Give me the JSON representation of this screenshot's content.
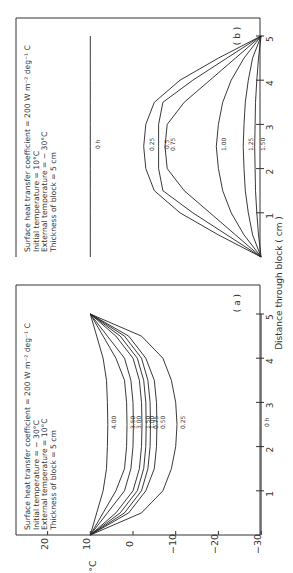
{
  "chart_data": [
    {
      "panel": "(a)",
      "type": "line",
      "title": "",
      "annotation": [
        "Surface heat transfer coefficient = 200 W m⁻² deg⁻¹ C",
        "Initial temperature = − 30°C",
        "External temperature = 10°C",
        "Thickness of block = 5 cm"
      ],
      "xlabel": "Distance through block ( cm )",
      "ylabel": "°C",
      "xticks": [
        "1",
        "2",
        "3",
        "4",
        "5"
      ],
      "yticks": [
        "20",
        "10",
        "0",
        "−10",
        "−20",
        "−30"
      ],
      "xlim": [
        0,
        5
      ],
      "ylim": [
        -30,
        20
      ],
      "x": [
        0,
        0.5,
        1,
        1.5,
        2,
        2.5,
        3,
        3.5,
        4,
        4.5,
        5
      ],
      "series": [
        {
          "name": "0 h",
          "values": [
            -30,
            -30,
            -30,
            -30,
            -30,
            -30,
            -30,
            -30,
            -30,
            -30,
            -30
          ]
        },
        {
          "name": "0.25",
          "values": [
            10,
            -2,
            -7,
            -9,
            -10,
            -10.3,
            -10,
            -9,
            -7,
            -2,
            10
          ]
        },
        {
          "name": "0.50",
          "values": [
            10,
            1,
            -3,
            -5,
            -5.5,
            -5.6,
            -5.5,
            -5,
            -3,
            1,
            10
          ]
        },
        {
          "name": "0.75",
          "values": [
            10,
            2,
            -2,
            -3.5,
            -4,
            -4.1,
            -4,
            -3.5,
            -2,
            2,
            10
          ]
        },
        {
          "name": "1.00",
          "values": [
            10,
            3,
            -1,
            -2.5,
            -3,
            -3.1,
            -3,
            -2.5,
            -1,
            3,
            10
          ]
        },
        {
          "name": "1.50",
          "values": [
            10,
            4,
            0,
            -1.5,
            -2,
            -2.1,
            -2,
            -1.5,
            0,
            4,
            10
          ]
        },
        {
          "name": "3.00",
          "values": [
            10,
            6,
            2,
            0.5,
            0,
            -0.1,
            0,
            0.5,
            2,
            6,
            10
          ]
        },
        {
          "name": "3.50",
          "values": [
            10,
            7,
            4,
            2,
            1.5,
            1.4,
            1.5,
            2,
            4,
            7,
            10
          ]
        },
        {
          "name": "4.00",
          "values": [
            10,
            8.5,
            7,
            6.2,
            6,
            5.9,
            6,
            6.2,
            7,
            8.5,
            10
          ]
        }
      ],
      "labels": [
        "0 h",
        "0.25",
        "0.50",
        "0.75",
        "1.00",
        "1.50",
        "3.00",
        "3.50",
        "4.00"
      ]
    },
    {
      "panel": "(b)",
      "type": "line",
      "title": "",
      "annotation": [
        "Surface heat transfer coefficient = 200 W m⁻² deg⁻¹ C",
        "Initial temperature = 10°C",
        "External temperature = − 30°C",
        "Thickness of block = 5 cm"
      ],
      "xlabel": "Distance through block ( cm )",
      "ylabel": "°C",
      "xticks": [
        "1",
        "2",
        "3",
        "4",
        "5"
      ],
      "xlim": [
        0,
        5
      ],
      "ylim": [
        -30,
        20
      ],
      "x": [
        0,
        0.5,
        1,
        1.5,
        2,
        2.5,
        3,
        3.5,
        4,
        4.5,
        5
      ],
      "series": [
        {
          "name": "0 h",
          "values": [
            10,
            10,
            10,
            10,
            10,
            10,
            10,
            10,
            10,
            10,
            10
          ]
        },
        {
          "name": "0.25",
          "values": [
            -30,
            -20,
            -11,
            -5,
            -3,
            -2.5,
            -3,
            -5,
            -11,
            -20,
            -30
          ]
        },
        {
          "name": "0.5",
          "values": [
            -30,
            -22,
            -14,
            -7,
            -6,
            -6,
            -6,
            -7,
            -14,
            -22,
            -30
          ]
        },
        {
          "name": "0.75",
          "values": [
            -30,
            -24,
            -18,
            -12,
            -8,
            -7.5,
            -8,
            -12,
            -18,
            -24,
            -30
          ]
        },
        {
          "name": "1.00",
          "values": [
            -30,
            -26,
            -23,
            -21,
            -20,
            -19.5,
            -20,
            -21,
            -23,
            -26,
            -30
          ]
        },
        {
          "name": "1.25",
          "values": [
            -30,
            -28,
            -27,
            -26.3,
            -26,
            -25.8,
            -26,
            -26.3,
            -27,
            -28,
            -30
          ]
        },
        {
          "name": "1.50",
          "values": [
            -30,
            -29.4,
            -29,
            -28.7,
            -28.6,
            -28.5,
            -28.6,
            -28.7,
            -29,
            -29.4,
            -30
          ]
        }
      ],
      "labels": [
        "0 h",
        "0.25",
        "0.5",
        "0.75",
        "1.00",
        "1.25",
        "1.50"
      ]
    }
  ],
  "figure": {
    "xlabel": "Distance through block ( cm )",
    "ylabel": "°C",
    "panel_a_tag": "( a )",
    "panel_b_tag": "( b )",
    "temp_ticks": [
      "20",
      "10",
      "0",
      "−10",
      "−20",
      "−30"
    ],
    "dist_ticks": [
      "1",
      "2",
      "3",
      "4",
      "5"
    ]
  }
}
